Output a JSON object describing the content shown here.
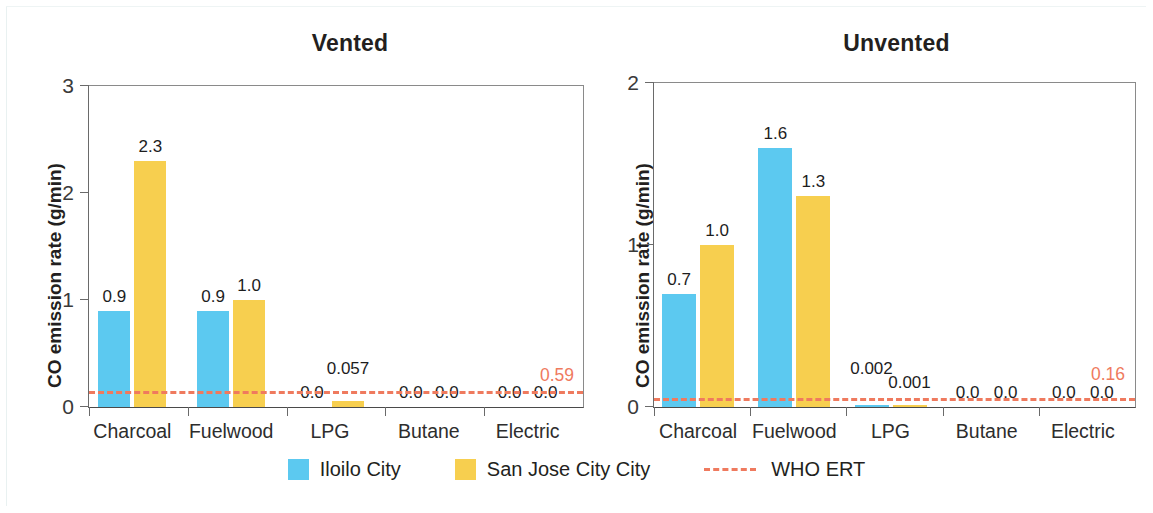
{
  "chart_data": [
    {
      "type": "bar",
      "title": "Vented",
      "xlabel": "",
      "ylabel": "CO emission rate (g/min)",
      "ylim": [
        0,
        3
      ],
      "yticks": [
        "0",
        "1",
        "2",
        "3"
      ],
      "ytick_values": [
        0,
        1,
        2,
        3
      ],
      "grid": false,
      "legend_position": "bottom-center-shared",
      "categories": [
        "Charcoal",
        "Fuelwood",
        "LPG",
        "Butane",
        "Electric"
      ],
      "series": [
        {
          "name": "Iloilo City",
          "color": "#5cc9f0",
          "values": [
            0.9,
            0.9,
            0.0,
            0.0,
            0.0
          ],
          "labels": [
            "0.9",
            "0.9",
            "0.0",
            "0.0",
            "0.0"
          ]
        },
        {
          "name": "San Jose City City",
          "color": "#f7cf4f",
          "values": [
            2.3,
            1.0,
            0.057,
            0.0,
            0.0
          ],
          "labels": [
            "2.3",
            "1.0",
            "0.057",
            "0.0",
            "0.0"
          ]
        }
      ],
      "reference_line": {
        "name": "WHO ERT",
        "value": 0.12,
        "label": "0.59",
        "color": "#ef7a5e",
        "style": "dashed"
      }
    },
    {
      "type": "bar",
      "title": "Unvented",
      "xlabel": "",
      "ylabel": "CO emission rate (g/min)",
      "ylim": [
        0,
        2
      ],
      "yticks": [
        "0",
        "1",
        "2"
      ],
      "ytick_values": [
        0,
        1,
        2
      ],
      "grid": false,
      "legend_position": "bottom-center-shared",
      "categories": [
        "Charcoal",
        "Fuelwood",
        "LPG",
        "Butane",
        "Electric"
      ],
      "series": [
        {
          "name": "Iloilo City",
          "color": "#5cc9f0",
          "values": [
            0.7,
            1.6,
            0.002,
            0.0,
            0.0
          ],
          "labels": [
            "0.7",
            "1.6",
            "0.002",
            "0.0",
            "0.0"
          ]
        },
        {
          "name": "San Jose City City",
          "color": "#f7cf4f",
          "values": [
            1.0,
            1.3,
            0.001,
            0.0,
            0.0
          ],
          "labels": [
            "1.0",
            "1.3",
            "0.001",
            "0.0",
            "0.0"
          ]
        }
      ],
      "reference_line": {
        "name": "WHO ERT",
        "value": 0.04,
        "label": "0.16",
        "color": "#ef7a5e",
        "style": "dashed"
      }
    }
  ],
  "legend": {
    "items": [
      {
        "label": "Iloilo City",
        "color": "#5cc9f0",
        "marker": "square"
      },
      {
        "label": "San Jose City City",
        "color": "#f7cf4f",
        "marker": "square"
      },
      {
        "label": "WHO ERT",
        "color": "#ef7a5e",
        "marker": "dashed-line"
      }
    ]
  }
}
